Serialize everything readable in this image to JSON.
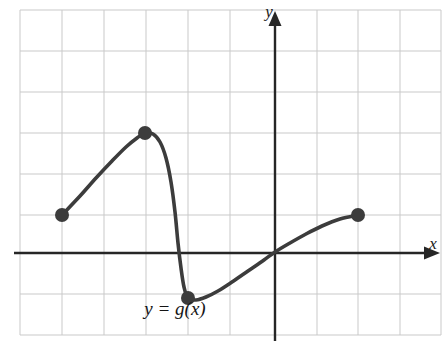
{
  "figure": {
    "width": 446,
    "height": 343,
    "background_color": "#ffffff"
  },
  "axes": {
    "x_axis_label": "x",
    "y_axis_label": "y",
    "axis_color": "#262626",
    "x_axis_pixel_y": 253,
    "y_axis_pixel_x": 275,
    "x_arrow_direction": "right",
    "y_arrow_direction": "up"
  },
  "grid": {
    "color": "#c9c9c9",
    "visible": true,
    "left": 20,
    "right": 441,
    "top": 10,
    "bottom": 335,
    "vertical_lines": [
      20,
      62,
      104,
      146,
      188,
      230,
      275,
      317,
      358,
      400,
      441
    ],
    "horizontal_lines": [
      10,
      51,
      92,
      133,
      174,
      215,
      253,
      294,
      335
    ],
    "cell_width": 42,
    "cell_height": 41
  },
  "curve": {
    "label": "y = g(x)",
    "label_pixel_x": 175,
    "label_pixel_y": 315,
    "stroke_color": "#3c3c3c",
    "stroke_width": 3.6,
    "marker_color": "#3c3c3c",
    "marker_radius": 7
  },
  "chart_data": {
    "type": "line",
    "title": "",
    "xlabel": "x",
    "ylabel": "y",
    "grid": true,
    "legend": "none",
    "annotations": [
      "y = g(x)"
    ],
    "xlim": [
      -6.07,
      3.95
    ],
    "ylim": [
      -2.0,
      5.93
    ],
    "axis_origin_pixel": [
      275,
      253
    ],
    "units_per_cell": [
      1,
      1
    ],
    "marked_points": [
      {
        "label": "left endpoint",
        "x": -5.07,
        "y": 0.93,
        "pixel": [
          62,
          215
        ]
      },
      {
        "label": "local maximum",
        "x": -3.1,
        "y": 2.93,
        "pixel": [
          145,
          133
        ]
      },
      {
        "label": "local minimum",
        "x": -2.07,
        "y": -1.1,
        "pixel": [
          188,
          298
        ]
      },
      {
        "label": "right endpoint",
        "x": 1.98,
        "y": 0.93,
        "pixel": [
          358,
          215
        ]
      }
    ],
    "x_intercepts": [
      -2.43,
      -0.02
    ],
    "path_pixels": [
      [
        62,
        215
      ],
      [
        80,
        196
      ],
      [
        96,
        178
      ],
      [
        112,
        161
      ],
      [
        126,
        147
      ],
      [
        137,
        138
      ],
      [
        145,
        133
      ],
      [
        153,
        134
      ],
      [
        160,
        142
      ],
      [
        166,
        158
      ],
      [
        171,
        182
      ],
      [
        175,
        212
      ],
      [
        178,
        243
      ],
      [
        181,
        268
      ],
      [
        184,
        287
      ],
      [
        188,
        298
      ],
      [
        196,
        300
      ],
      [
        206,
        297
      ],
      [
        218,
        291
      ],
      [
        232,
        282
      ],
      [
        248,
        271
      ],
      [
        264,
        260
      ],
      [
        275,
        252
      ],
      [
        290,
        243
      ],
      [
        306,
        234
      ],
      [
        322,
        226
      ],
      [
        340,
        219
      ],
      [
        358,
        215
      ]
    ]
  }
}
